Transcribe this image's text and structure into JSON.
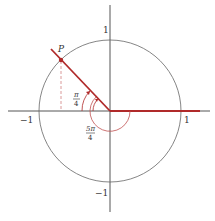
{
  "diagram": {
    "colors": {
      "axis": "#555555",
      "circle": "#555555",
      "terminal_side": "#b02a2a",
      "arc": "#c05050",
      "projection": "#d08080"
    },
    "labels": {
      "point": "P",
      "y_pos": "1",
      "y_neg": "−1",
      "x_pos": "1",
      "x_neg": "−1",
      "angle_small_num": "π",
      "angle_small_den": "4",
      "angle_large_num": "5π",
      "angle_large_den": "4"
    },
    "angles": [
      "π/4",
      "5π/4"
    ]
  }
}
